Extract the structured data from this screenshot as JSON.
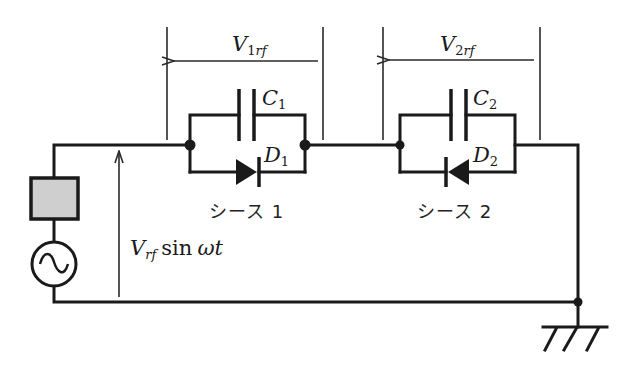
{
  "diagram": {
    "type": "circuit",
    "voltages": {
      "v1rf": {
        "symbol": "V",
        "sub_num": "1",
        "sub_it": "rf"
      },
      "v2rf": {
        "symbol": "V",
        "sub_num": "2",
        "sub_it": "rf"
      },
      "source": {
        "symbol": "V",
        "sub_it": "rf",
        "func": "sin",
        "arg": "ωt"
      }
    },
    "components": {
      "c1": {
        "symbol": "C",
        "sub": "1"
      },
      "d1": {
        "symbol": "D",
        "sub": "1",
        "direction": "right"
      },
      "c2": {
        "symbol": "C",
        "sub": "2"
      },
      "d2": {
        "symbol": "D",
        "sub": "2",
        "direction": "left"
      },
      "impedance": {
        "fill": "#cfcfcf"
      },
      "ac_source": {
        "kind": "sine"
      },
      "ground": {
        "kind": "chassis"
      }
    },
    "labels": {
      "sheath1": "シース 1",
      "sheath2": "シース 2"
    },
    "colors": {
      "line": "#1a1a1a",
      "impedance_fill": "#cfcfcf"
    }
  }
}
